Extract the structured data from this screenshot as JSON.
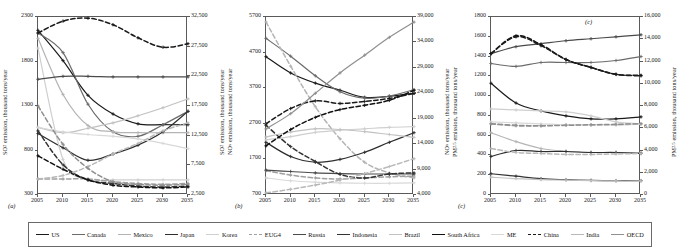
{
  "figure": {
    "panels": [
      {
        "tag": "(a)",
        "tag_inside": null,
        "ylabel_left": "SO2 emission, thousand tons/year",
        "ylabel_right": "SO2 emission, thousand tons/year",
        "pollutant": "SO2",
        "left_ticks": [
          "2300",
          "1800",
          "1300",
          "800",
          "300"
        ],
        "right_ticks": [
          "32,500",
          "27,500",
          "22,500",
          "17,500",
          "12,500",
          "7,500",
          "2,500"
        ],
        "x_ticks": [
          "2005",
          "2010",
          "2015",
          "2020",
          "2025",
          "2030",
          "2035"
        ]
      },
      {
        "tag": "(b)",
        "tag_inside": null,
        "ylabel_left": "NOx emission, thousand tons/year",
        "ylabel_right": "NOx emission, thousand tons/year",
        "pollutant": "NOx",
        "left_ticks": [
          "5700",
          "4700",
          "3700",
          "2700",
          "1700",
          "700"
        ],
        "right_ticks": [
          "39,000",
          "34,000",
          "29,000",
          "24,000",
          "19,000",
          "14,000",
          "9,000",
          "4,000"
        ],
        "x_ticks": [
          "2005",
          "2010",
          "2015",
          "2020",
          "2025",
          "2030",
          "2035"
        ]
      },
      {
        "tag": "(c)",
        "tag_inside": "(c)",
        "ylabel_left": "PM2.5 emission, thousand tons/year",
        "ylabel_right": "PM2.5 emission, thousand tons/year",
        "pollutant": "PM2.5",
        "left_ticks": [
          "1800",
          "1600",
          "1400",
          "1200",
          "1000",
          "800",
          "600",
          "400",
          "200",
          "0"
        ],
        "right_ticks": [
          "16,000",
          "14,000",
          "12,000",
          "10,000",
          "8,000",
          "6,000",
          "4,000",
          "2,000",
          "0"
        ],
        "x_ticks": [
          "2005",
          "2010",
          "2015",
          "2020",
          "2025",
          "2030",
          "2035"
        ]
      }
    ],
    "legend": {
      "items": [
        {
          "label": "US",
          "color": "#1a1a1a",
          "dash": "solid"
        },
        {
          "label": "Canada",
          "color": "#6b6b6b",
          "dash": "solid"
        },
        {
          "label": "Mexico",
          "color": "#b4b4b4",
          "dash": "solid"
        },
        {
          "label": "Japan",
          "color": "#2e2e2e",
          "dash": "solid"
        },
        {
          "label": "Korea",
          "color": "#cfcfcf",
          "dash": "solid"
        },
        {
          "label": "EUG4",
          "color": "#a0a0a0",
          "dash": "dashed"
        },
        {
          "label": "Russia",
          "color": "#4a4a4a",
          "dash": "solid"
        },
        {
          "label": "Indonesia",
          "color": "#333333",
          "dash": "solid"
        },
        {
          "label": "Brazil",
          "color": "#c2c2c2",
          "dash": "solid"
        },
        {
          "label": "South Africa",
          "color": "#111111",
          "dash": "solid"
        },
        {
          "label": "ME",
          "color": "#d8d8d8",
          "dash": "solid"
        },
        {
          "label": "China",
          "color": "#1a1a1a",
          "dash": "dashed"
        },
        {
          "label": "India",
          "color": "#b8b8b8",
          "dash": "solid"
        },
        {
          "label": "OECD",
          "color": "#8f8f8f",
          "dash": "solid"
        }
      ]
    }
  },
  "chart_data": [
    {
      "type": "line",
      "panel": "(a)",
      "title": "",
      "xlabel": "",
      "ylabel": "SO2 emission, thousand tons/year",
      "ylabel_right": "SO2 emission, thousand tons/year",
      "x": [
        2005,
        2010,
        2015,
        2020,
        2025,
        2030,
        2035
      ],
      "xlim": [
        2005,
        2035
      ],
      "ylim": [
        300,
        2300
      ],
      "ylim_right": [
        2500,
        32500
      ],
      "grid": false,
      "legend_position": "below-figure",
      "series": [
        {
          "name": "US",
          "axis": "left",
          "dash": "solid",
          "color": "#1a1a1a",
          "values": [
            2150,
            1810,
            1420,
            1210,
            1100,
            1090,
            1090
          ]
        },
        {
          "name": "Canada",
          "axis": "left",
          "dash": "solid",
          "color": "#6b6b6b",
          "values": [
            2120,
            1900,
            1320,
            1010,
            960,
            1090,
            1240
          ]
        },
        {
          "name": "Mexico",
          "axis": "left",
          "dash": "solid",
          "color": "#b4b4b4",
          "values": [
            2060,
            1430,
            1080,
            1010,
            1000,
            1000,
            1000
          ]
        },
        {
          "name": "Japan",
          "axis": "left",
          "dash": "solid",
          "color": "#2e2e2e",
          "values": [
            990,
            830,
            690,
            760,
            860,
            1010,
            1240
          ]
        },
        {
          "name": "Korea",
          "axis": "left",
          "dash": "solid",
          "color": "#cfcfcf",
          "values": [
            1950,
            700,
            480,
            470,
            470,
            470,
            470
          ]
        },
        {
          "name": "EUG4",
          "axis": "left",
          "dash": "dashed",
          "color": "#a0a0a0",
          "values": [
            480,
            480,
            480,
            450,
            430,
            420,
            430
          ]
        },
        {
          "name": "Russia",
          "axis": "right",
          "dash": "solid",
          "color": "#4a4a4a",
          "values": [
            22000,
            22500,
            22500,
            22400,
            22400,
            22400,
            22400
          ]
        },
        {
          "name": "Indonesia",
          "axis": "left",
          "dash": "dashed",
          "color": "#333333",
          "values": [
            1020,
            640,
            470,
            430,
            400,
            390,
            400
          ]
        },
        {
          "name": "Brazil",
          "axis": "left",
          "dash": "solid",
          "color": "#c2c2c2",
          "values": [
            1060,
            1000,
            1050,
            1110,
            1190,
            1280,
            1380
          ]
        },
        {
          "name": "South Africa",
          "axis": "left",
          "dash": "dashed",
          "color": "#111111",
          "values": [
            740,
            590,
            470,
            410,
            390,
            380,
            390
          ]
        },
        {
          "name": "ME",
          "axis": "left",
          "dash": "solid",
          "color": "#d8d8d8",
          "values": [
            1060,
            1010,
            980,
            960,
            930,
            880,
            820
          ]
        },
        {
          "name": "China",
          "axis": "right",
          "dash": "dashed",
          "color": "#1a1a1a",
          "values": [
            29800,
            31800,
            32300,
            31200,
            29000,
            27400,
            28000
          ]
        },
        {
          "name": "India",
          "axis": "left",
          "dash": "dashed",
          "color": "#b8b8b8",
          "values": [
            480,
            520,
            620,
            760,
            880,
            1020,
            1110
          ]
        },
        {
          "name": "OECD",
          "axis": "left",
          "dash": "dashed",
          "color": "#8f8f8f",
          "values": [
            1300,
            870,
            600,
            450,
            420,
            410,
            420
          ]
        }
      ]
    },
    {
      "type": "line",
      "panel": "(b)",
      "title": "",
      "xlabel": "",
      "ylabel": "NOx emission, thousand tons/year",
      "ylabel_right": "NOx emission, thousand tons/year",
      "x": [
        2005,
        2010,
        2015,
        2020,
        2025,
        2030,
        2035
      ],
      "xlim": [
        2005,
        2035
      ],
      "ylim": [
        700,
        5700
      ],
      "ylim_right": [
        4000,
        39000
      ],
      "grid": false,
      "legend_position": "below-figure",
      "series": [
        {
          "name": "US",
          "axis": "right",
          "dash": "solid",
          "color": "#1a1a1a",
          "values": [
            31200,
            28000,
            26000,
            24600,
            23200,
            23400,
            24000
          ]
        },
        {
          "name": "Canada",
          "axis": "left",
          "dash": "solid",
          "color": "#6b6b6b",
          "values": [
            5100,
            4600,
            4050,
            3600,
            3420,
            3480,
            3660
          ]
        },
        {
          "name": "Mexico",
          "axis": "left",
          "dash": "dashed",
          "color": "#b4b4b4",
          "values": [
            5560,
            4320,
            3180,
            2280,
            1620,
            1320,
            1180
          ]
        },
        {
          "name": "Japan",
          "axis": "left",
          "dash": "solid",
          "color": "#2e2e2e",
          "values": [
            2180,
            1780,
            1620,
            1700,
            1900,
            2180,
            2450
          ]
        },
        {
          "name": "Korea",
          "axis": "left",
          "dash": "solid",
          "color": "#cfcfcf",
          "values": [
            2250,
            2340,
            2460,
            2520,
            2560,
            2600,
            2620
          ]
        },
        {
          "name": "EUG4",
          "axis": "left",
          "dash": "dashed",
          "color": "#a0a0a0",
          "values": [
            1380,
            1260,
            1180,
            1150,
            1180,
            1210,
            1230
          ]
        },
        {
          "name": "Russia",
          "axis": "left",
          "dash": "solid",
          "color": "#4a4a4a",
          "values": [
            1400,
            1360,
            1320,
            1300,
            1290,
            1290,
            1290
          ]
        },
        {
          "name": "Indonesia",
          "axis": "left",
          "dash": "dashed",
          "color": "#333333",
          "values": [
            2660,
            2060,
            1640,
            1280,
            1180,
            1290,
            1320
          ]
        },
        {
          "name": "Brazil",
          "axis": "left",
          "dash": "solid",
          "color": "#c2c2c2",
          "values": [
            2330,
            2470,
            2560,
            2540,
            2480,
            2400,
            2320
          ]
        },
        {
          "name": "South Africa",
          "axis": "left",
          "dash": "dashed",
          "color": "#111111",
          "values": [
            2080,
            2540,
            2880,
            3100,
            3220,
            3360,
            3640
          ]
        },
        {
          "name": "ME",
          "axis": "left",
          "dash": "solid",
          "color": "#d8d8d8",
          "values": [
            1180,
            1100,
            1060,
            1040,
            1030,
            1030,
            1040
          ]
        },
        {
          "name": "China",
          "axis": "right",
          "dash": "dashed",
          "color": "#1a1a1a",
          "values": [
            18000,
            21000,
            22500,
            22000,
            22400,
            23000,
            24000
          ]
        },
        {
          "name": "India",
          "axis": "left",
          "dash": "dashed",
          "color": "#b8b8b8",
          "values": [
            760,
            860,
            980,
            1120,
            1300,
            1500,
            1720
          ]
        },
        {
          "name": "OECD",
          "axis": "right",
          "dash": "solid",
          "color": "#8f8f8f",
          "values": [
            17000,
            20000,
            24000,
            28000,
            31500,
            35000,
            38000
          ]
        }
      ]
    },
    {
      "type": "line",
      "panel": "(c)",
      "title": "",
      "xlabel": "",
      "ylabel": "PM2.5 emission, thousand tons/year",
      "ylabel_right": "PM2.5 emission, thousand tons/year",
      "x": [
        2005,
        2010,
        2015,
        2020,
        2025,
        2030,
        2035
      ],
      "xlim": [
        2005,
        2035
      ],
      "ylim": [
        0,
        1800
      ],
      "ylim_right": [
        0,
        16000
      ],
      "grid": false,
      "legend_position": "below-figure",
      "series": [
        {
          "name": "US",
          "axis": "left",
          "dash": "solid",
          "color": "#1a1a1a",
          "values": [
            1130,
            930,
            850,
            800,
            770,
            770,
            790
          ]
        },
        {
          "name": "Canada",
          "axis": "left",
          "dash": "solid",
          "color": "#6b6b6b",
          "values": [
            1330,
            1300,
            1340,
            1340,
            1340,
            1360,
            1400
          ]
        },
        {
          "name": "Mexico",
          "axis": "left",
          "dash": "solid",
          "color": "#b4b4b4",
          "values": [
            630,
            540,
            470,
            440,
            430,
            430,
            430
          ]
        },
        {
          "name": "Japan",
          "axis": "left",
          "dash": "solid",
          "color": "#2e2e2e",
          "values": [
            390,
            450,
            440,
            440,
            430,
            430,
            420
          ]
        },
        {
          "name": "Korea",
          "axis": "left",
          "dash": "solid",
          "color": "#cfcfcf",
          "values": [
            870,
            860,
            850,
            840,
            800,
            740,
            720
          ]
        },
        {
          "name": "EUG4",
          "axis": "left",
          "dash": "dashed",
          "color": "#a0a0a0",
          "values": [
            720,
            700,
            700,
            710,
            710,
            710,
            720
          ]
        },
        {
          "name": "Russia",
          "axis": "left",
          "dash": "solid",
          "color": "#4a4a4a",
          "values": [
            1430,
            1500,
            1530,
            1560,
            1580,
            1600,
            1620
          ]
        },
        {
          "name": "Indonesia",
          "axis": "left",
          "dash": "solid",
          "color": "#333333",
          "values": [
            215,
            190,
            165,
            155,
            148,
            145,
            145
          ]
        },
        {
          "name": "Brazil",
          "axis": "left",
          "dash": "solid",
          "color": "#c2c2c2",
          "values": [
            180,
            165,
            155,
            150,
            145,
            142,
            142
          ]
        },
        {
          "name": "South Africa",
          "axis": "left",
          "dash": "dashed",
          "color": "#111111",
          "values": [
            1430,
            1610,
            1520,
            1370,
            1290,
            1220,
            1210
          ]
        },
        {
          "name": "ME",
          "axis": "left",
          "dash": "solid",
          "color": "#d8d8d8",
          "values": [
            740,
            730,
            720,
            710,
            710,
            710,
            715
          ]
        },
        {
          "name": "China",
          "axis": "left",
          "dash": "dashed",
          "color": "#1a1a1a",
          "values": [
            1430,
            1600,
            1510,
            1370,
            1290,
            1220,
            1205
          ]
        },
        {
          "name": "India",
          "axis": "left",
          "dash": "dashed",
          "color": "#b8b8b8",
          "values": [
            470,
            430,
            420,
            410,
            410,
            415,
            420
          ]
        },
        {
          "name": "OECD",
          "axis": "left",
          "dash": "dashed",
          "color": "#8f8f8f",
          "values": [
            720,
            705,
            700,
            705,
            710,
            715,
            720
          ]
        }
      ]
    }
  ]
}
